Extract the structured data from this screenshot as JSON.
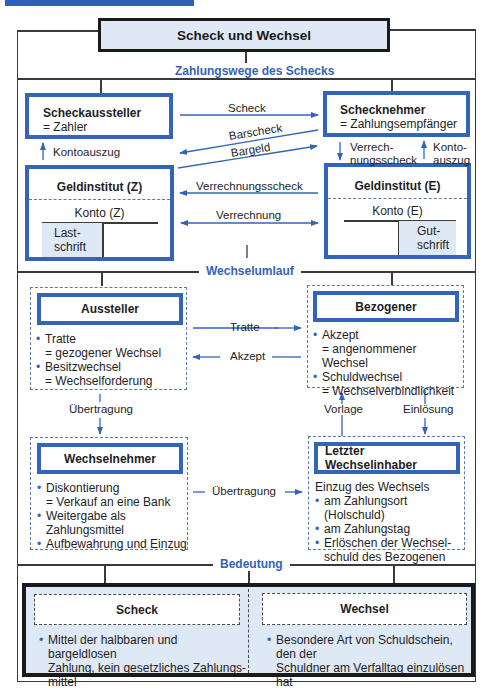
{
  "header": {
    "title": "Scheck und Wechsel"
  },
  "sections": {
    "zahlungswege": "Zahlungswege des Schecks",
    "wechselumlauf": "Wechselumlauf",
    "bedeutung": "Bedeutung"
  },
  "scheck_flow": {
    "aussteller": {
      "title": "Scheckaussteller",
      "subtitle": "= Zahler"
    },
    "nehmer": {
      "title": "Schecknehmer",
      "subtitle": "= Zahlungsempfänger"
    },
    "bank_z": {
      "title": "Geldinstitut (Z)",
      "konto": "Konto (Z)",
      "cell_l1": "Last-",
      "cell_l2": "schrift"
    },
    "bank_e": {
      "title": "Geldinstitut (E)",
      "konto": "Konto (E)",
      "cell_l1": "Gut-",
      "cell_l2": "schrift"
    },
    "arrows": {
      "scheck": "Scheck",
      "barscheck": "Barscheck",
      "bargeld": "Bargeld",
      "kontoauszug_left": "Kontoauszug",
      "verrechnungsscheck_right_l1": "Verrech-",
      "verrechnungsscheck_right_l2": "nungsscheck",
      "kontoauszug_right_l1": "Konto-",
      "kontoauszug_right_l2": "auszug",
      "verrechnungsscheck": "Verrechnungsscheck",
      "verrechnung": "Verrechnung"
    }
  },
  "wechsel_flow": {
    "aussteller": {
      "title": "Aussteller",
      "items": [
        {
          "main": "Tratte",
          "sub": "= gezogener Wechsel"
        },
        {
          "main": "Besitzwechsel",
          "sub": "= Wechselforderung"
        }
      ]
    },
    "bezogener": {
      "title": "Bezogener",
      "items": [
        {
          "main": "Akzept",
          "sub": "= angenommener Wechsel"
        },
        {
          "main": "Schuldwechsel",
          "sub": "= Wechselverbindlichkeit"
        }
      ]
    },
    "wechselnehmer": {
      "title": "Wechselnehmer",
      "items": [
        {
          "main": "Diskontierung",
          "sub": "= Verkauf an eine Bank"
        },
        {
          "main": "Weitergabe als",
          "sub": "Zahlungsmittel"
        },
        {
          "main": "Aufbewahrung und Einzug",
          "sub": ""
        }
      ]
    },
    "letzter": {
      "title": "Letzter Wechselinhaber",
      "intro": "Einzug des Wechsels",
      "items": [
        {
          "main": "am Zahlungsort (Holschuld)",
          "sub": ""
        },
        {
          "main": "am Zahlungstag",
          "sub": ""
        },
        {
          "main": "Erlöschen der Wechsel-",
          "sub": "schuld des Bezogenen"
        }
      ]
    },
    "arrows": {
      "tratte": "Tratte",
      "akzept": "Akzept",
      "uebertragung_down": "Übertragung",
      "uebertragung_right": "Übertragung",
      "vorlage": "Vorlage",
      "einloesung": "Einlösung"
    }
  },
  "bedeutung": {
    "scheck": {
      "title": "Scheck",
      "text_l1": "Mittel der halbbaren und bargeldlosen",
      "text_l2": "Zahlung, kein gesetzliches Zahlungs-",
      "text_l3": "mittel"
    },
    "wechsel": {
      "title": "Wechsel",
      "text_l1": "Besondere Art von Schuldschein, den der",
      "text_l2": "Schuldner am Verfalltag einzulösen hat"
    }
  },
  "colors": {
    "accent_blue": "#3464b8",
    "shade_blue": "#dfe8f5",
    "frame_dark": "#1a1a1a"
  }
}
